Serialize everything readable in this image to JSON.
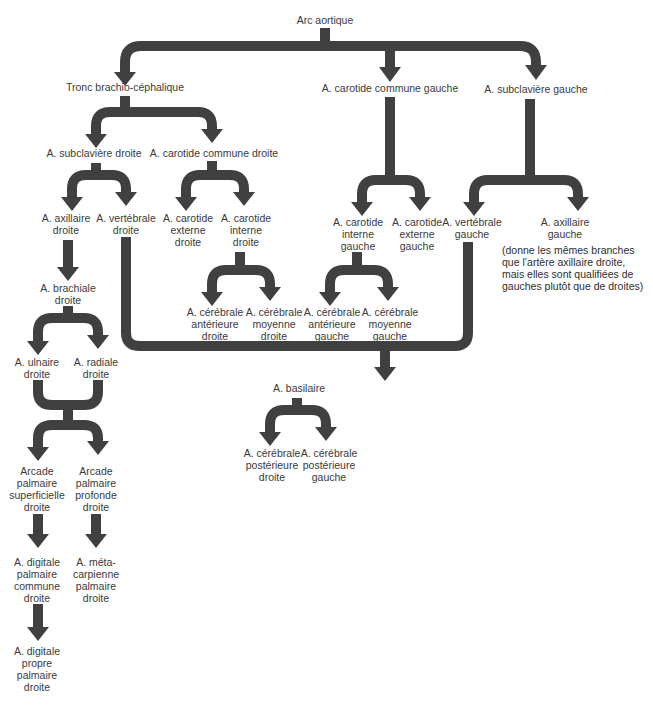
{
  "diagram": {
    "colors": {
      "connector": "#404040",
      "text": "#3a3a3a",
      "background": "#ffffff"
    },
    "nodes": {
      "arc_aortique": "Arc aortique",
      "tronc_brachio": "Tronc brachio-céphalique",
      "carotide_commune_gauche": "A. carotide commune gauche",
      "subclaviere_gauche": "A. subclavière gauche",
      "subclaviere_droite": "A. subclavière droite",
      "carotide_commune_droite": "A. carotide commune droite",
      "axillaire_droite": "A. axillaire\ndroite",
      "vertebrale_droite": "A. vertébrale\ndroite",
      "carotide_externe_droite": "A. carotide\nexterne\ndroite",
      "carotide_interne_droite": "A. carotide\ninterne\ndroite",
      "carotide_interne_gauche": "A. carotide\ninterne\ngauche",
      "carotide_externe_gauche": "A. carotide\nexterne\ngauche",
      "vertebrale_gauche": "A. vertébrale\ngauche",
      "axillaire_gauche": "A. axillaire\ngauche",
      "axillaire_gauche_note": "(donne les mêmes branches\nque l’artère axillaire droite,\nmais elles sont qualifiées de\ngauches plutôt que de droites)",
      "brachiale_droite": "A. brachiale\ndroite",
      "cerebrale_anterieure_droite": "A. cérébrale\nantérieure\ndroite",
      "cerebrale_moyenne_droite": "A. cérébrale\nmoyenne\ndroite",
      "cerebrale_anterieure_gauche": "A. cérébrale\nantérieure\ngauche",
      "cerebrale_moyenne_gauche": "A. cérébrale\nmoyenne\ngauche",
      "ulnaire_droite": "A. ulnaire\ndroite",
      "radiale_droite": "A. radiale\ndroite",
      "basilaire": "A. basilaire",
      "cerebrale_posterieure_droite": "A. cérébrale\npostérieure\ndroite",
      "cerebrale_posterieure_gauche": "A. cérébrale\npostérieure\ngauche",
      "arcade_superficielle": "Arcade\npalmaire\nsuperficielle\ndroite",
      "arcade_profonde": "Arcade\npalmaire\nprofonde\ndroite",
      "digitale_commune": "A. digitale\npalmaire\ncommune\ndroite",
      "metacarpienne": "A. méta-\ncarpienne\npalmaire\ndroite",
      "digitale_propre": "A. digitale\npropre\npalmaire\ndroite"
    }
  }
}
